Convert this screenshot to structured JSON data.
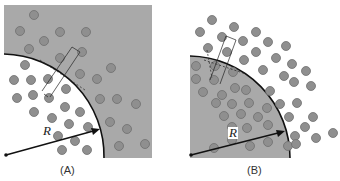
{
  "colors": {
    "background": "#ffffff",
    "medium": "#a9a9a9",
    "particle_fill": "#8f8f8f",
    "particle_stroke": "#6e6e6e",
    "boundary": "#111111"
  },
  "panels": [
    {
      "id": "A",
      "caption": "(A)",
      "radius_label": "R",
      "description": "White quarter-disc cavity inside a gray medium; particles dispersed both inside and outside"
    },
    {
      "id": "B",
      "caption": "(B)",
      "radius_label": "R",
      "description": "Gray quarter-disc droplet in white surroundings; particles densely packed inside and dispersed outside"
    }
  ]
}
